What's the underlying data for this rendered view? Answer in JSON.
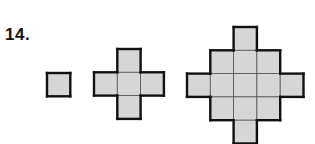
{
  "problem": {
    "number": "14."
  },
  "colors": {
    "fill": "#d6d6d6",
    "stroke": "#111111"
  },
  "figures": [
    {
      "name": "figure-1",
      "cells": [
        [
          0,
          0
        ]
      ],
      "origin": [
        47,
        73
      ]
    },
    {
      "name": "figure-2",
      "cells": [
        [
          1,
          0
        ],
        [
          0,
          1
        ],
        [
          1,
          1
        ],
        [
          2,
          1
        ],
        [
          1,
          2
        ]
      ],
      "origin": [
        94,
        49
      ]
    },
    {
      "name": "figure-3",
      "cells": [
        [
          2,
          0
        ],
        [
          1,
          1
        ],
        [
          2,
          1
        ],
        [
          3,
          1
        ],
        [
          0,
          2
        ],
        [
          1,
          2
        ],
        [
          2,
          2
        ],
        [
          3,
          2
        ],
        [
          4,
          2
        ],
        [
          1,
          3
        ],
        [
          2,
          3
        ],
        [
          3,
          3
        ],
        [
          2,
          4
        ]
      ],
      "origin": [
        187,
        27
      ]
    }
  ],
  "cell_size": 23.3
}
